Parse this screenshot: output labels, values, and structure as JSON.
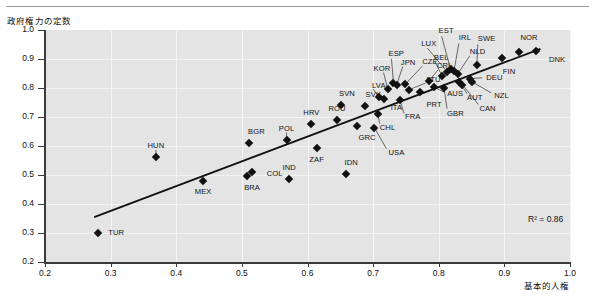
{
  "figure": {
    "y_axis_title": "政府権力の定数",
    "x_axis_title": "基本的人権",
    "r2_label": "R² = 0.86"
  },
  "chart_data": {
    "type": "scatter",
    "title": "",
    "xlabel": "基本的人権",
    "ylabel": "政府権力の定数",
    "xlim": [
      0.2,
      1.0
    ],
    "ylim": [
      0.2,
      1.0
    ],
    "xticks": [
      "0.2",
      "0.3",
      "0.4",
      "0.5",
      "0.6",
      "0.7",
      "0.8",
      "0.9",
      "1.0"
    ],
    "yticks": [
      "0.2",
      "0.3",
      "0.4",
      "0.5",
      "0.6",
      "0.7",
      "0.8",
      "0.9",
      "1.0"
    ],
    "grid": true,
    "legend": "none",
    "annotations": [
      "R² = 0.86"
    ],
    "trendline": {
      "type": "linear",
      "r2": 0.86,
      "x_start": 0.275,
      "y_start": 0.355,
      "x_end": 0.955,
      "y_end": 0.935
    },
    "point_color": "#111111",
    "marker": "diamond",
    "points": [
      {
        "label": "TUR",
        "x": 0.281,
        "y": 0.301,
        "lx": 10,
        "ly": 0
      },
      {
        "label": "HUN",
        "x": 0.369,
        "y": 0.562,
        "lx": 0,
        "ly": -11
      },
      {
        "label": "MEX",
        "x": 0.441,
        "y": 0.478,
        "lx": 0,
        "ly": 11
      },
      {
        "label": "BRA",
        "x": 0.508,
        "y": 0.498,
        "lx": -3,
        "ly": 12
      },
      {
        "label": "COL",
        "x": 0.515,
        "y": 0.512,
        "lx": 15,
        "ly": 2
      },
      {
        "label": "BGR",
        "x": 0.511,
        "y": 0.612,
        "lx": -1,
        "ly": -11
      },
      {
        "label": "POL",
        "x": 0.568,
        "y": 0.622,
        "lx": 0,
        "ly": -11
      },
      {
        "label": "IND",
        "x": 0.572,
        "y": 0.487,
        "lx": 0,
        "ly": -11
      },
      {
        "label": "HRV",
        "x": 0.606,
        "y": 0.675,
        "lx": 0,
        "ly": -11
      },
      {
        "label": "ZAF",
        "x": 0.614,
        "y": 0.592,
        "lx": 0,
        "ly": 12
      },
      {
        "label": "IDN",
        "x": 0.658,
        "y": 0.505,
        "lx": -1,
        "ly": -11
      },
      {
        "label": "ROU",
        "x": 0.645,
        "y": 0.691,
        "lx": 0,
        "ly": -11
      },
      {
        "label": "SVN",
        "x": 0.651,
        "y": 0.742,
        "lx": -2,
        "ly": -11
      },
      {
        "label": "SVK",
        "x": 0.687,
        "y": 0.738,
        "lx": 1,
        "ly": -11
      },
      {
        "label": "GRC",
        "x": 0.676,
        "y": 0.668,
        "lx": 1,
        "ly": 12
      },
      {
        "label": "USA",
        "x": 0.702,
        "y": 0.663,
        "lx": 14,
        "ly": 25
      },
      {
        "label": "CHL",
        "x": 0.707,
        "y": 0.712,
        "lx": 2,
        "ly": 14
      },
      {
        "label": "LVA",
        "x": 0.709,
        "y": 0.769,
        "lx": -7,
        "ly": -11
      },
      {
        "label": "ITA",
        "x": 0.716,
        "y": 0.761,
        "lx": 7,
        "ly": 9
      },
      {
        "label": "KOR",
        "x": 0.722,
        "y": 0.798,
        "lx": -14,
        "ly": -20
      },
      {
        "label": "ESP",
        "x": 0.731,
        "y": 0.818,
        "lx": -5,
        "ly": -29
      },
      {
        "label": "JPN",
        "x": 0.736,
        "y": 0.812,
        "lx": 4,
        "ly": -22
      },
      {
        "label": "FRA",
        "x": 0.741,
        "y": 0.757,
        "lx": 5,
        "ly": 17
      },
      {
        "label": "CZE",
        "x": 0.749,
        "y": 0.813,
        "lx": 17,
        "ly": -22
      },
      {
        "label": "LTU",
        "x": 0.754,
        "y": 0.793,
        "lx": 18,
        "ly": -10
      },
      {
        "label": "PRT",
        "x": 0.772,
        "y": 0.786,
        "lx": 6,
        "ly": 13
      },
      {
        "label": "CRI",
        "x": 0.785,
        "y": 0.824,
        "lx": 8,
        "ly": -15
      },
      {
        "label": "AUS",
        "x": 0.793,
        "y": 0.803,
        "lx": 13,
        "ly": 7
      },
      {
        "label": "BEL",
        "x": 0.805,
        "y": 0.842,
        "lx": -8,
        "ly": -18
      },
      {
        "label": "GBR",
        "x": 0.808,
        "y": 0.801,
        "lx": 3,
        "ly": 26
      },
      {
        "label": "LUX",
        "x": 0.813,
        "y": 0.855,
        "lx": -26,
        "ly": -28
      },
      {
        "label": "EST",
        "x": 0.818,
        "y": 0.865,
        "lx": -12,
        "ly": -38
      },
      {
        "label": "IRL",
        "x": 0.823,
        "y": 0.857,
        "lx": 5,
        "ly": -33
      },
      {
        "label": "NLD",
        "x": 0.829,
        "y": 0.849,
        "lx": 12,
        "ly": -22
      },
      {
        "label": "AUT",
        "x": 0.831,
        "y": 0.822,
        "lx": 8,
        "ly": 16
      },
      {
        "label": "CAN",
        "x": 0.836,
        "y": 0.812,
        "lx": 17,
        "ly": 24
      },
      {
        "label": "DEU",
        "x": 0.848,
        "y": 0.832,
        "lx": 16,
        "ly": -1
      },
      {
        "label": "NZL",
        "x": 0.851,
        "y": 0.821,
        "lx": 22,
        "ly": 14
      },
      {
        "label": "SWE",
        "x": 0.858,
        "y": 0.878,
        "lx": 1,
        "ly": -26
      },
      {
        "label": "FIN",
        "x": 0.896,
        "y": 0.905,
        "lx": 1,
        "ly": 14
      },
      {
        "label": "NOR",
        "x": 0.923,
        "y": 0.925,
        "lx": 1,
        "ly": -14
      },
      {
        "label": "DNK",
        "x": 0.948,
        "y": 0.926,
        "lx": 13,
        "ly": 9
      }
    ],
    "leaders": [
      {
        "label": "KOR",
        "x": 0.722,
        "y": 0.798,
        "lx": -4,
        "ly": -16
      },
      {
        "label": "ESP",
        "x": 0.731,
        "y": 0.818,
        "lx": -2,
        "ly": -24
      },
      {
        "label": "JPN",
        "x": 0.736,
        "y": 0.812,
        "lx": 6,
        "ly": -18
      },
      {
        "label": "CZE",
        "x": 0.749,
        "y": 0.813,
        "lx": 17,
        "ly": -18
      },
      {
        "label": "LTU",
        "x": 0.754,
        "y": 0.793,
        "lx": 17,
        "ly": -7
      },
      {
        "label": "LVA",
        "x": 0.709,
        "y": 0.769,
        "lx": -6,
        "ly": -8
      },
      {
        "label": "CRI",
        "x": 0.785,
        "y": 0.824,
        "lx": 9,
        "ly": -11
      },
      {
        "label": "BEL",
        "x": 0.805,
        "y": 0.842,
        "lx": -7,
        "ly": -14
      },
      {
        "label": "LUX",
        "x": 0.813,
        "y": 0.855,
        "lx": -20,
        "ly": -24
      },
      {
        "label": "EST",
        "x": 0.818,
        "y": 0.865,
        "lx": -9,
        "ly": -33
      },
      {
        "label": "IRL",
        "x": 0.823,
        "y": 0.857,
        "lx": 5,
        "ly": -28
      },
      {
        "label": "NLD",
        "x": 0.829,
        "y": 0.849,
        "lx": 12,
        "ly": -18
      },
      {
        "label": "AUT",
        "x": 0.831,
        "y": 0.822,
        "lx": 8,
        "ly": 12
      },
      {
        "label": "CAN",
        "x": 0.836,
        "y": 0.812,
        "lx": 16,
        "ly": 20
      },
      {
        "label": "DEU",
        "x": 0.848,
        "y": 0.832,
        "lx": 12,
        "ly": -1
      },
      {
        "label": "NZL",
        "x": 0.851,
        "y": 0.821,
        "lx": 19,
        "ly": 11
      },
      {
        "label": "GBR",
        "x": 0.808,
        "y": 0.801,
        "lx": 3,
        "ly": 21
      },
      {
        "label": "AUS",
        "x": 0.793,
        "y": 0.803,
        "lx": 10,
        "ly": 5
      },
      {
        "label": "USA",
        "x": 0.702,
        "y": 0.663,
        "lx": 12,
        "ly": 21
      },
      {
        "label": "CHL",
        "x": 0.707,
        "y": 0.712,
        "lx": 2,
        "ly": 10
      },
      {
        "label": "SWE",
        "x": 0.858,
        "y": 0.878,
        "lx": 1,
        "ly": -21
      },
      {
        "label": "HUN",
        "x": 0.369,
        "y": 0.562,
        "lx": 0,
        "ly": -7
      },
      {
        "label": "POL",
        "x": 0.568,
        "y": 0.622,
        "lx": 0,
        "ly": -7
      },
      {
        "label": "FRA",
        "x": 0.741,
        "y": 0.757,
        "lx": 4,
        "ly": 13
      }
    ]
  }
}
